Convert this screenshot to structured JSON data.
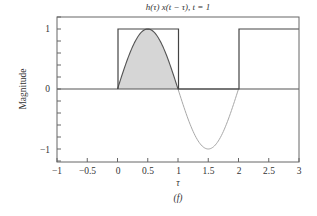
{
  "chart_data": {
    "type": "line",
    "title": "h(τ) x(t − τ), t = 1",
    "xlabel": "τ",
    "ylabel": "Magnitude",
    "caption": "(f)",
    "xlim": [
      -1,
      3
    ],
    "ylim": [
      -1.2,
      1.2
    ],
    "grid": false,
    "x_ticks": [
      -1,
      -0.5,
      0,
      0.5,
      1,
      1.5,
      2,
      2.5,
      3
    ],
    "x_tick_labels": [
      "−1",
      "−0.5",
      "0",
      "0.5",
      "1",
      "1.5",
      "2",
      "2.5",
      "3"
    ],
    "y_ticks": [
      -1,
      0,
      1
    ],
    "y_tick_labels": [
      "−1",
      "0",
      "1"
    ],
    "y_minor_ticks": [
      -1.2,
      -0.8,
      -0.6,
      -0.4,
      -0.2,
      0.2,
      0.4,
      0.6,
      0.8,
      1.2
    ],
    "series": [
      {
        "name": "x(t − τ) rectangular pulse",
        "style": "dark-line",
        "color": "#444444",
        "x": [
          -1,
          0,
          0,
          1,
          1,
          2,
          2,
          3
        ],
        "y": [
          0,
          0,
          1,
          1,
          0,
          0,
          1,
          1
        ]
      },
      {
        "name": "h(τ) = sin(πτ), 0 ≤ τ ≤ 2",
        "style": "line",
        "color_positive": "#555555",
        "color_negative": "#aaaaaa",
        "x": [
          0,
          0.25,
          0.5,
          0.75,
          1,
          1.25,
          1.5,
          1.75,
          2
        ],
        "y": [
          0,
          0.707,
          1,
          0.707,
          0,
          -0.707,
          -1,
          -0.707,
          0
        ]
      },
      {
        "name": "product h(τ) x(t − τ) (shaded area)",
        "style": "filled-area",
        "color": "#d6d6d6",
        "x": [
          0,
          0.25,
          0.5,
          0.75,
          1
        ],
        "y": [
          0,
          0.707,
          1,
          0.707,
          0
        ]
      }
    ]
  },
  "labels": {
    "title": "h(τ) x(t − τ), t = 1",
    "xlabel": "τ",
    "ylabel": "Magnitude",
    "caption": "(f)",
    "x_tick_labels": [
      "−1",
      "−0.5",
      "0",
      "0.5",
      "1",
      "1.5",
      "2",
      "2.5",
      "3"
    ],
    "y_tick_labels": [
      "1",
      "0",
      "−1"
    ]
  },
  "colors": {
    "frame": "#666666",
    "pulse": "#444444",
    "sine_positive": "#555555",
    "sine_negative": "#a8a8a8",
    "fill": "#d6d6d6",
    "text": "#333333"
  }
}
